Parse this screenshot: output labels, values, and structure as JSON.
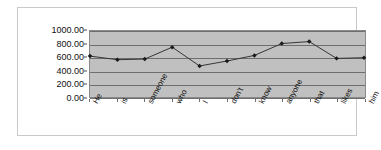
{
  "chart_data": {
    "type": "line",
    "title": "",
    "xlabel": "",
    "ylabel": "",
    "categories": [
      "He",
      "is",
      "someone",
      "who",
      "I",
      "don't",
      "know",
      "anyone",
      "that",
      "likes",
      "him"
    ],
    "values": [
      620,
      565,
      575,
      755,
      470,
      545,
      630,
      810,
      840,
      585,
      595
    ],
    "series": [
      {
        "name": "Series1",
        "values": [
          620,
          565,
          575,
          755,
          470,
          545,
          630,
          810,
          840,
          585,
          595
        ]
      }
    ],
    "ylim": [
      0,
      1000
    ],
    "ytick_values": [
      0,
      200,
      400,
      600,
      800,
      1000
    ],
    "ytick_labels": [
      "0.00",
      "200.00",
      "400.00",
      "600.00",
      "800.00",
      "1000.00"
    ],
    "grid": true,
    "legend": false,
    "legend_position": "none",
    "marker": "diamond",
    "line_color": "#333333",
    "marker_color": "#1a1a1a",
    "plot_background_color": "#c0c0c0",
    "chart_background_color": "#ffffff",
    "gridline_color": "#6e6e6e"
  }
}
